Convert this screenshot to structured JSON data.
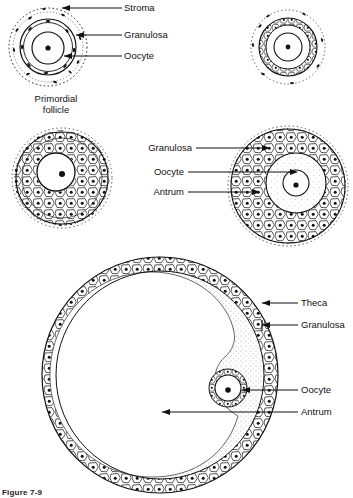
{
  "figure": {
    "caption": "Figure 7-9",
    "background_color": "#ffffff",
    "ink_color": "#000000"
  },
  "panels": [
    {
      "id": "primordial-follicle",
      "caption_line1": "Primordial",
      "caption_line2": "follicle",
      "labels": [
        "Stroma",
        "Granulosa",
        "Oocyte"
      ]
    },
    {
      "id": "primary-follicle-top-right",
      "caption_line1": "",
      "caption_line2": "",
      "labels": []
    },
    {
      "id": "preantral-follicle-mid-left",
      "caption_line1": "",
      "caption_line2": "",
      "labels": []
    },
    {
      "id": "antral-follicle-mid-right",
      "caption_line1": "",
      "caption_line2": "",
      "labels": [
        "Granulosa",
        "Oocyte",
        "Antrum"
      ]
    },
    {
      "id": "graafian-follicle-bottom",
      "caption_line1": "",
      "caption_line2": "",
      "labels": [
        "Theca",
        "Granulosa",
        "Oocyte",
        "Antrum"
      ]
    }
  ],
  "labels": {
    "stroma": "Stroma",
    "granulosa": "Granulosa",
    "oocyte": "Oocyte",
    "antrum": "Antrum",
    "theca": "Theca",
    "granulosa2": "Granulosa",
    "oocyte2": "Oocyte",
    "antrum2": "Antrum",
    "granulosa3": "Granulosa",
    "oocyte3": "Oocyte",
    "theca3": "Theca",
    "antrum3": "Antrum",
    "primordial_line1": "Primordial",
    "primordial_line2": "follicle"
  }
}
